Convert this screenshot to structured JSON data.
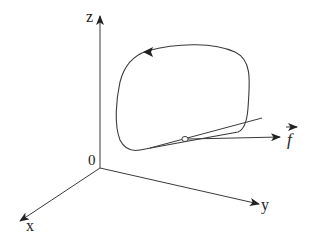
{
  "diagram": {
    "title": "",
    "type": "3d-axes-closed-curve-with-force-vector",
    "axes": {
      "z": {
        "label": "z"
      },
      "x": {
        "label": "x"
      },
      "y": {
        "label": "y"
      },
      "origin": {
        "label": "0"
      }
    },
    "curve": {
      "description": "closed loop with direction arrow at top, oriented counter-clockwise",
      "direction_arrow": "leftward at top"
    },
    "tangent_line": {
      "description": "straight line tangent to the curve near the bottom right"
    },
    "point": {
      "description": "small open circle on the curve"
    },
    "force": {
      "label": "f",
      "vector_notation": true
    },
    "colors": {
      "stroke": "#3a3a3a",
      "background": "#ffffff"
    }
  }
}
